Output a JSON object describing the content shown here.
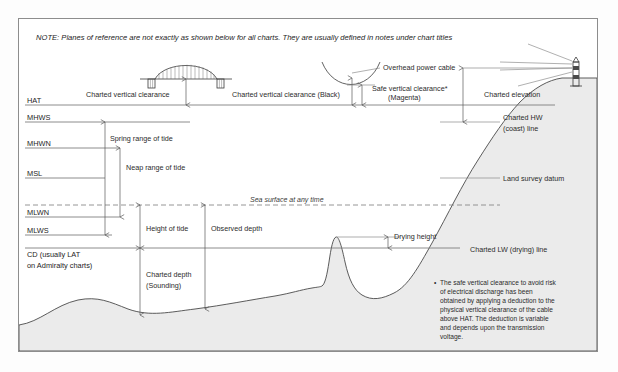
{
  "note": {
    "text": "NOTE: Planes of reference are not exactly as shown below for all charts. They are usually defined in notes under chart titles"
  },
  "datums": [
    {
      "key": "HAT",
      "label": "HAT",
      "y": 105
    },
    {
      "key": "MHWS",
      "label": "MHWS",
      "y": 122
    },
    {
      "key": "MHWN",
      "label": "MHWN",
      "y": 148
    },
    {
      "key": "MSL",
      "label": "MSL",
      "y": 178
    },
    {
      "key": "MLWN",
      "label": "MLWN",
      "y": 217
    },
    {
      "key": "MLWS",
      "label": "MLWS",
      "y": 235
    },
    {
      "key": "CD1",
      "label": "CD (usually LAT",
      "y": 248
    },
    {
      "key": "CD2",
      "label": "on Admiralty charts)",
      "y": 259
    }
  ],
  "measures": {
    "charted_vertical_clearance": "Charted vertical clearance",
    "charted_vertical_clearance_black": "Charted vertical clearance (Black)",
    "safe_vertical_clearance_1": "Safe vertical clearance*",
    "safe_vertical_clearance_2": "(Magenta)",
    "overhead_power_cable": "Overhead power cable",
    "charted_elevation": "Charted elevation",
    "spring_range": "Spring range of tide",
    "neap_range": "Neap range of tide",
    "height_of_tide": "Height of tide",
    "observed_depth": "Observed depth",
    "charted_depth_1": "Charted depth",
    "charted_depth_2": "(Sounding)",
    "drying_height": "Drying height",
    "sea_surface": "Sea surface at any time",
    "charted_hw_1": "Charted HW",
    "charted_hw_2": "(coast) line",
    "land_survey_datum": "Land survey datum",
    "charted_lw": "Charted LW (drying) line"
  },
  "footnote": {
    "bullet": "•",
    "lines": [
      "The safe vertical clearance to avoid risk",
      "of  electrical  discharge  has  been",
      "obtained by applying a deduction to the",
      "physical vertical clearance of the cable",
      "above HAT. The deduction is variable",
      "and  depends  upon  the  transmission",
      "voltage."
    ]
  },
  "colors": {
    "border": "#8d8d8d",
    "line": "#6f6f6f",
    "seabed_fill": "#ebebeb",
    "text": "#2b2b2b"
  }
}
